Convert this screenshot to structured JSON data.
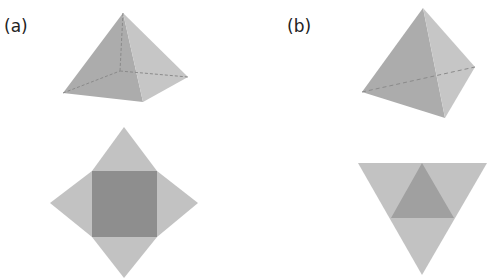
{
  "panels": [
    {
      "label": "(a)",
      "solid": "square pyramid",
      "net": "square pyramid net: central square with four triangular faces"
    },
    {
      "label": "(b)",
      "solid": "triangular pyramid (tetrahedron)",
      "net": "tetrahedron net: large triangle subdivided into four triangles"
    }
  ],
  "colors": {
    "face_light": "#c4c4c4",
    "face_mid": "#b3b3b3",
    "face_dark": "#a3a3a3",
    "base": "#8c8c8c",
    "hidden_edge": "#8a8a8a"
  }
}
